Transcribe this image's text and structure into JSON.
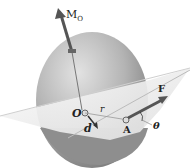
{
  "diagram": {
    "labels": {
      "moment": "M",
      "moment_sub": "O",
      "origin": "O",
      "radius": "r",
      "distance": "d",
      "point": "A",
      "force": "F",
      "angle": "θ"
    },
    "colors": {
      "sphere_light": "#d8d8d8",
      "sphere_dark": "#8a8a8a",
      "plane": "#ececec",
      "vector": "#555555",
      "background": "#ffffff"
    }
  }
}
